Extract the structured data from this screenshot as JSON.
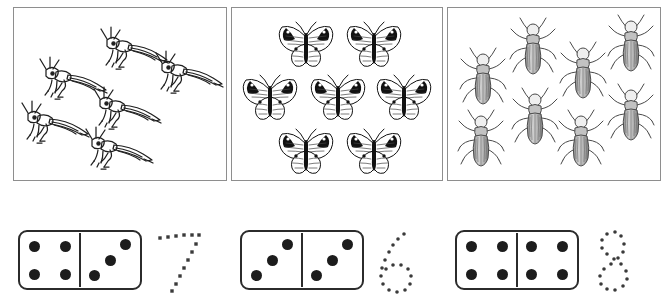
{
  "worksheet": {
    "title": "Counting insects and dominoes worksheet",
    "ink_color": "#1c1c1c",
    "box_border_color": "#8e8e8e"
  },
  "picture_boxes": [
    {
      "name": "grasshoppers-box",
      "subject": "grasshopper",
      "count": 6,
      "count_label": "6",
      "items": [
        {
          "x": 85,
          "y": 18,
          "scale": 1.0
        },
        {
          "x": 24,
          "y": 48,
          "scale": 1.0
        },
        {
          "x": 140,
          "y": 42,
          "scale": 1.0
        },
        {
          "x": 78,
          "y": 78,
          "scale": 1.0
        },
        {
          "x": 6,
          "y": 92,
          "scale": 1.0
        },
        {
          "x": 70,
          "y": 118,
          "scale": 1.0
        }
      ]
    },
    {
      "name": "butterflies-box",
      "subject": "butterfly",
      "count": 7,
      "count_label": "7",
      "items": [
        {
          "x": 42,
          "y": 10,
          "scale": 1.0
        },
        {
          "x": 110,
          "y": 10,
          "scale": 1.0
        },
        {
          "x": 6,
          "y": 63,
          "scale": 1.0
        },
        {
          "x": 74,
          "y": 63,
          "scale": 1.0
        },
        {
          "x": 140,
          "y": 63,
          "scale": 1.0
        },
        {
          "x": 42,
          "y": 117,
          "scale": 1.0
        },
        {
          "x": 110,
          "y": 117,
          "scale": 1.0
        }
      ]
    },
    {
      "name": "beetles-box",
      "subject": "beetle",
      "count": 8,
      "count_label": "8",
      "items": [
        {
          "x": 12,
          "y": 38,
          "scale": 1.0
        },
        {
          "x": 62,
          "y": 8,
          "scale": 1.0
        },
        {
          "x": 112,
          "y": 32,
          "scale": 1.0
        },
        {
          "x": 160,
          "y": 5,
          "scale": 1.0
        },
        {
          "x": 64,
          "y": 78,
          "scale": 1.0
        },
        {
          "x": 160,
          "y": 74,
          "scale": 1.0
        },
        {
          "x": 10,
          "y": 100,
          "scale": 1.0
        },
        {
          "x": 110,
          "y": 100,
          "scale": 1.0
        }
      ]
    }
  ],
  "answers": [
    {
      "name": "answer-seven",
      "numeral": "7",
      "total": 7,
      "domino": {
        "left_pips": 4,
        "right_pips": 3,
        "left_layout": "four-corners",
        "right_layout": "diagonal-three"
      }
    },
    {
      "name": "answer-six",
      "numeral": "6",
      "total": 6,
      "domino": {
        "left_pips": 3,
        "right_pips": 3,
        "left_layout": "diagonal-three",
        "right_layout": "diagonal-three"
      }
    },
    {
      "name": "answer-eight",
      "numeral": "8",
      "total": 8,
      "domino": {
        "left_pips": 4,
        "right_pips": 4,
        "left_layout": "four-corners",
        "right_layout": "four-corners"
      }
    }
  ],
  "pip_layouts": {
    "four-corners": [
      [
        30,
        18
      ],
      [
        30,
        18
      ]
    ],
    "diagonal-three": []
  },
  "pip_positions": {
    "four-corners": [
      {
        "x": 24,
        "y": 25
      },
      {
        "x": 76,
        "y": 25
      },
      {
        "x": 24,
        "y": 75
      },
      {
        "x": 76,
        "y": 75
      }
    ],
    "diagonal-three": [
      {
        "x": 76,
        "y": 22
      },
      {
        "x": 50,
        "y": 50
      },
      {
        "x": 24,
        "y": 78
      }
    ]
  },
  "numeral_dot_paths": {
    "7": [
      {
        "x": 6,
        "y": 16
      },
      {
        "x": 14,
        "y": 15
      },
      {
        "x": 22,
        "y": 14
      },
      {
        "x": 30,
        "y": 13
      },
      {
        "x": 38,
        "y": 13
      },
      {
        "x": 45,
        "y": 13
      },
      {
        "x": 42,
        "y": 22
      },
      {
        "x": 38,
        "y": 30
      },
      {
        "x": 34,
        "y": 38
      },
      {
        "x": 30,
        "y": 46
      },
      {
        "x": 26,
        "y": 54
      },
      {
        "x": 22,
        "y": 62
      },
      {
        "x": 18,
        "y": 69
      }
    ],
    "6": [
      {
        "x": 36,
        "y": 12
      },
      {
        "x": 30,
        "y": 17
      },
      {
        "x": 25,
        "y": 23
      },
      {
        "x": 21,
        "y": 30
      },
      {
        "x": 17,
        "y": 38
      },
      {
        "x": 14,
        "y": 46
      },
      {
        "x": 13,
        "y": 54
      },
      {
        "x": 15,
        "y": 62
      },
      {
        "x": 21,
        "y": 68
      },
      {
        "x": 29,
        "y": 70
      },
      {
        "x": 37,
        "y": 68
      },
      {
        "x": 42,
        "y": 62
      },
      {
        "x": 43,
        "y": 54
      },
      {
        "x": 40,
        "y": 47
      },
      {
        "x": 33,
        "y": 43
      },
      {
        "x": 25,
        "y": 43
      },
      {
        "x": 18,
        "y": 47
      }
    ],
    "8": [
      {
        "x": 30,
        "y": 10
      },
      {
        "x": 22,
        "y": 12
      },
      {
        "x": 17,
        "y": 18
      },
      {
        "x": 17,
        "y": 26
      },
      {
        "x": 22,
        "y": 32
      },
      {
        "x": 29,
        "y": 37
      },
      {
        "x": 36,
        "y": 42
      },
      {
        "x": 41,
        "y": 49
      },
      {
        "x": 42,
        "y": 57
      },
      {
        "x": 38,
        "y": 64
      },
      {
        "x": 30,
        "y": 68
      },
      {
        "x": 22,
        "y": 67
      },
      {
        "x": 16,
        "y": 62
      },
      {
        "x": 15,
        "y": 54
      },
      {
        "x": 19,
        "y": 47
      },
      {
        "x": 26,
        "y": 42
      },
      {
        "x": 33,
        "y": 36
      },
      {
        "x": 38,
        "y": 30
      },
      {
        "x": 39,
        "y": 22
      },
      {
        "x": 36,
        "y": 14
      }
    ]
  }
}
